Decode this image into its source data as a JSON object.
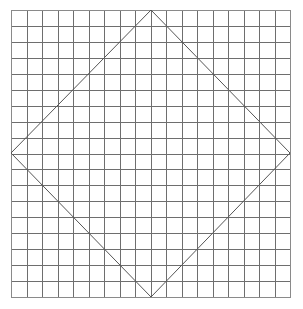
{
  "figure": {
    "background_color": "#ffffff",
    "width": 303,
    "height": 309
  },
  "grid": {
    "name": "square-grid",
    "columns": 18,
    "rows": 18,
    "left": 11,
    "top": 10,
    "right": 290,
    "bottom": 297,
    "cell_width": 15.5,
    "cell_height": 15.944,
    "line_color": "#6e6e6e",
    "border_color": "#8a8a8a",
    "line_width": 1
  },
  "diamond": {
    "name": "inscribed-diamond",
    "description": "Rotated square whose vertices touch the midpoints of the grid's sides",
    "stroke_color": "#555555",
    "stroke_width": 1,
    "fill": "none",
    "vertices": [
      {
        "label": "top",
        "x": 151,
        "y": 10
      },
      {
        "label": "right",
        "x": 290,
        "y": 153
      },
      {
        "label": "bottom",
        "x": 151,
        "y": 297
      },
      {
        "label": "left",
        "x": 11,
        "y": 153
      }
    ]
  },
  "chart_data": {
    "type": "diagram",
    "grid_columns": 18,
    "grid_rows": 18,
    "shape": "rotated-square",
    "shape_vertices": [
      [
        151,
        10
      ],
      [
        290,
        153
      ],
      [
        151,
        297
      ],
      [
        11,
        153
      ]
    ]
  }
}
